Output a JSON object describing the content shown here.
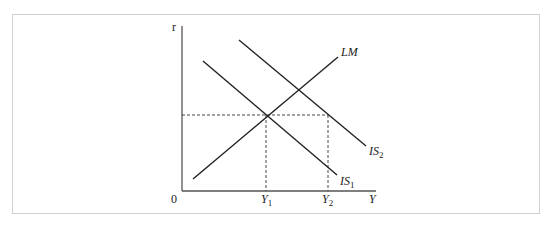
{
  "header": {
    "clipped_text": "",
    "note": "cut-off line of text above the figure, illegible"
  },
  "diagram": {
    "type": "IS-LM",
    "axes": {
      "y_label": "r",
      "x_label": "Y",
      "origin_label": "0"
    },
    "curves": [
      {
        "name": "LM",
        "label": "LM",
        "from": [
          193,
          179
        ],
        "to": [
          338,
          57
        ]
      },
      {
        "name": "IS1",
        "label_main": "IS",
        "label_sub": "1",
        "from": [
          203,
          61
        ],
        "to": [
          337,
          175
        ]
      },
      {
        "name": "IS2",
        "label_main": "IS",
        "label_sub": "2",
        "from": [
          239,
          40
        ],
        "to": [
          366,
          146
        ]
      }
    ],
    "x_ticks": [
      {
        "label_main": "Y",
        "label_sub": "1",
        "x": 266
      },
      {
        "label_main": "Y",
        "label_sub": "2",
        "x": 328
      }
    ],
    "equilibrium_r_y": 115,
    "colors": {
      "line": "#222222",
      "axis": "#555555",
      "frame": "#cfcfcf"
    }
  }
}
